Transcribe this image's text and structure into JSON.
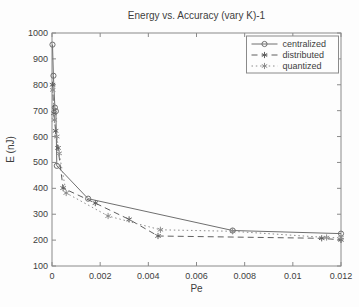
{
  "chart_data": {
    "type": "line",
    "title": "Energy vs. Accuracy (vary K)-1",
    "xlabel": "Pe",
    "ylabel": "E (nJ)",
    "xlim": [
      0,
      0.012
    ],
    "ylim": [
      100,
      1000
    ],
    "xticks": {
      "values": [
        0,
        0.002,
        0.004,
        0.006,
        0.008,
        0.01,
        0.012
      ],
      "labels": [
        "0",
        "0.002",
        "0.004",
        "0.006",
        "0.008",
        "0.01",
        "0.012"
      ]
    },
    "yticks": {
      "values": [
        100,
        200,
        300,
        400,
        500,
        600,
        700,
        800,
        900,
        1000
      ],
      "labels": [
        "100",
        "200",
        "300",
        "400",
        "500",
        "600",
        "700",
        "800",
        "900",
        "1000"
      ]
    },
    "grid": false,
    "legend_position": "top-right",
    "colors": {
      "background": "#ffffff",
      "axis": "#8a8a8a",
      "text": "#3d3d3d",
      "centralized": "#6f6f6f",
      "distributed": "#5f5f5f",
      "quantized": "#8c8c8c"
    },
    "series": [
      {
        "name": "centralized",
        "line": "solid",
        "marker": "circle",
        "points": [
          [
            2e-05,
            955
          ],
          [
            6e-05,
            835
          ],
          [
            0.00012,
            712
          ],
          [
            0.00016,
            698
          ],
          [
            0.0002,
            487
          ],
          [
            0.0015,
            360
          ],
          [
            0.0075,
            237
          ],
          [
            0.012,
            225
          ]
        ]
      },
      {
        "name": "distributed",
        "line": "dashed",
        "marker": "asterisk",
        "points": [
          [
            2e-05,
            800
          ],
          [
            8e-05,
            690
          ],
          [
            0.00015,
            622
          ],
          [
            0.00025,
            556
          ],
          [
            0.00046,
            401
          ],
          [
            0.0018,
            343
          ],
          [
            0.0032,
            280
          ],
          [
            0.0044,
            216
          ],
          [
            0.0112,
            207
          ],
          [
            0.012,
            201
          ]
        ]
      },
      {
        "name": "quantized",
        "line": "dotted",
        "marker": "asterisk",
        "points": [
          [
            3e-05,
            780
          ],
          [
            0.0001,
            664
          ],
          [
            0.0002,
            600
          ],
          [
            0.0003,
            535
          ],
          [
            0.00059,
            382
          ],
          [
            0.00233,
            293
          ],
          [
            0.0045,
            240
          ],
          [
            0.0075,
            234
          ],
          [
            0.0114,
            210
          ],
          [
            0.012,
            209
          ]
        ]
      }
    ]
  }
}
